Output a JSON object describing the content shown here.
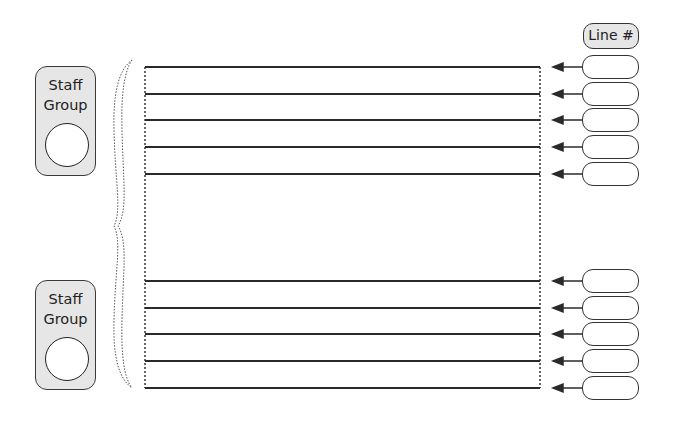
{
  "diagram": {
    "type": "staff-lines-template",
    "header": {
      "label": "Line #"
    },
    "staff_groups": [
      {
        "label_line1": "Staff",
        "label_line2": "Group",
        "circle": "empty",
        "lines": 5
      },
      {
        "label_line1": "Staff",
        "label_line2": "Group",
        "circle": "empty",
        "lines": 5
      }
    ],
    "line_number_slots": [
      "",
      "",
      "",
      "",
      "",
      "",
      "",
      "",
      "",
      ""
    ],
    "connector": "dotted-curly-brace",
    "arrow_direction": "left",
    "colors": {
      "group_fill": "#e6e6e6",
      "stroke": "#333333",
      "background": "#ffffff"
    }
  }
}
